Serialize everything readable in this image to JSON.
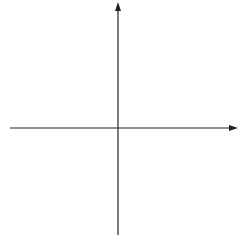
{
  "chart_data": {
    "type": "scatter",
    "title": "",
    "xlabel": "x",
    "ylabel": "y",
    "xlim": [
      -6,
      6
    ],
    "ylim": [
      -6,
      6
    ],
    "grid": true,
    "grid_style": "dotted",
    "x_ticks": [
      "-5",
      "-4",
      "-3",
      "-2",
      "-1",
      "1",
      "2",
      "3",
      "4",
      "5"
    ],
    "y_ticks": [
      "5",
      "4",
      "3",
      "2",
      "1",
      "-1",
      "-2",
      "-3",
      "-4",
      "-5"
    ],
    "series": []
  },
  "labels": {
    "x_axis": "x",
    "y_axis": "y"
  }
}
